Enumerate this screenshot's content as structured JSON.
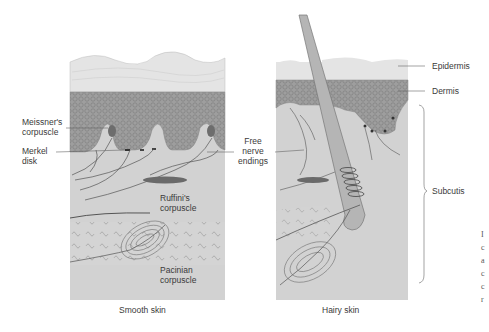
{
  "figure": {
    "panels": [
      {
        "id": "smooth",
        "caption": "Smooth skin"
      },
      {
        "id": "hairy",
        "caption": "Hairy skin"
      }
    ],
    "labels": {
      "meissner": [
        "Meissner's",
        "corpuscle"
      ],
      "merkel": [
        "Merkel",
        "disk"
      ],
      "free_nerve": [
        "Free",
        "nerve",
        "endings"
      ],
      "ruffini": [
        "Ruffini's",
        "corpuscle"
      ],
      "pacinian": [
        "Pacinian",
        "corpuscle"
      ],
      "epidermis": "Epidermis",
      "dermis": "Dermis",
      "subcutis": "Subcutis"
    },
    "edge_text": [
      "I",
      "c",
      "a",
      "c",
      "c",
      "r"
    ],
    "colors": {
      "epidermis": "#e3e3e3",
      "dermis": "#9a9a9a",
      "subcutis": "#d2d2d2",
      "hair": "#b5b5b5",
      "line": "#555555"
    }
  }
}
